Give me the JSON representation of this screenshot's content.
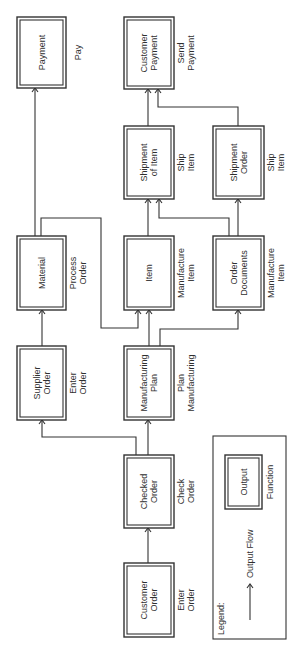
{
  "diagram": {
    "title": "",
    "orientation": "rotated-90-ccw",
    "nodes": [
      {
        "id": "payment",
        "output": [
          "Payment"
        ],
        "function": [
          "Pay"
        ],
        "x": 17,
        "y": 17,
        "w": 49,
        "h": 71
      },
      {
        "id": "customer-payment",
        "output": [
          "Customer",
          "Payment"
        ],
        "function": [
          "Send",
          "Payment"
        ],
        "x": 124,
        "y": 17,
        "w": 50,
        "h": 72
      },
      {
        "id": "shipment-of-item",
        "output": [
          "Shipment",
          "of Item"
        ],
        "function": [
          "Ship",
          "Item"
        ],
        "x": 124,
        "y": 126,
        "w": 50,
        "h": 73
      },
      {
        "id": "shipment-order",
        "output": [
          "Shipment",
          "Order"
        ],
        "function": [
          "Ship",
          "Item"
        ],
        "x": 213,
        "y": 126,
        "w": 51,
        "h": 73
      },
      {
        "id": "material",
        "output": [
          "Material"
        ],
        "function": [
          "Process",
          "Order"
        ],
        "x": 17,
        "y": 236,
        "w": 49,
        "h": 74
      },
      {
        "id": "item",
        "output": [
          "Item"
        ],
        "function": [
          "Manufacture",
          "Item"
        ],
        "x": 124,
        "y": 236,
        "w": 50,
        "h": 74
      },
      {
        "id": "order-documents",
        "output": [
          "Order",
          "Documents"
        ],
        "function": [
          "Manufacture",
          "Item"
        ],
        "x": 213,
        "y": 236,
        "w": 51,
        "h": 74
      },
      {
        "id": "supplier-order",
        "output": [
          "Supplier",
          "Order"
        ],
        "function": [
          "Enter",
          "Order"
        ],
        "x": 17,
        "y": 346,
        "w": 49,
        "h": 74
      },
      {
        "id": "manufacturing-plan",
        "output": [
          "Manufacturing",
          "Plan"
        ],
        "function": [
          "Plan",
          "Manufacturing"
        ],
        "x": 124,
        "y": 346,
        "w": 50,
        "h": 74
      },
      {
        "id": "checked-order",
        "output": [
          "Checked",
          "Order"
        ],
        "function": [
          "Check",
          "Order"
        ],
        "x": 124,
        "y": 455,
        "w": 50,
        "h": 73
      },
      {
        "id": "customer-order",
        "output": [
          "Customer",
          "Order"
        ],
        "function": [
          "Enter",
          "Order"
        ],
        "x": 124,
        "y": 563,
        "w": 50,
        "h": 74
      }
    ],
    "edges": [
      {
        "from": "customer-order",
        "to": "checked-order",
        "points": [
          [
            148,
            563
          ],
          [
            148,
            528
          ]
        ]
      },
      {
        "from": "checked-order",
        "to": "manufacturing-plan",
        "points": [
          [
            148,
            455
          ],
          [
            148,
            420
          ]
        ]
      },
      {
        "from": "checked-order",
        "to": "supplier-order",
        "points": [
          [
            136,
            455
          ],
          [
            136,
            437
          ],
          [
            42,
            437
          ],
          [
            42,
            420
          ]
        ]
      },
      {
        "from": "supplier-order",
        "to": "material",
        "points": [
          [
            42,
            346
          ],
          [
            42,
            310
          ]
        ]
      },
      {
        "from": "manufacturing-plan",
        "to": "item",
        "points": [
          [
            149,
            346
          ],
          [
            149,
            310
          ]
        ]
      },
      {
        "from": "manufacturing-plan",
        "to": "order-documents",
        "points": [
          [
            160,
            346
          ],
          [
            160,
            329
          ],
          [
            238,
            329
          ],
          [
            238,
            310
          ]
        ]
      },
      {
        "from": "material",
        "to": "payment",
        "points": [
          [
            35,
            236
          ],
          [
            35,
            88
          ]
        ]
      },
      {
        "from": "material",
        "to": "item",
        "points": [
          [
            41,
            236
          ],
          [
            41,
            218
          ],
          [
            101,
            218
          ],
          [
            101,
            328
          ],
          [
            138,
            328
          ],
          [
            138,
            310
          ]
        ]
      },
      {
        "from": "item",
        "to": "shipment-of-item",
        "points": [
          [
            148,
            236
          ],
          [
            148,
            199
          ]
        ]
      },
      {
        "from": "order-documents",
        "to": "shipment-of-item",
        "points": [
          [
            229,
            236
          ],
          [
            229,
            218
          ],
          [
            159,
            218
          ],
          [
            159,
            199
          ]
        ]
      },
      {
        "from": "order-documents",
        "to": "shipment-order",
        "points": [
          [
            238,
            236
          ],
          [
            238,
            199
          ]
        ]
      },
      {
        "from": "shipment-of-item",
        "to": "customer-payment",
        "points": [
          [
            148,
            126
          ],
          [
            148,
            89
          ]
        ]
      },
      {
        "from": "shipment-order",
        "to": "customer-payment",
        "points": [
          [
            238,
            126
          ],
          [
            238,
            107
          ],
          [
            158,
            107
          ],
          [
            158,
            89
          ]
        ]
      }
    ]
  },
  "legend": {
    "title": "Legend:",
    "flow_label": "Output Flow",
    "sample_output": "Output",
    "sample_function": "Function",
    "frame": {
      "x": 213,
      "y": 436,
      "w": 73,
      "h": 203
    },
    "sample_box": {
      "x": 225,
      "y": 455,
      "w": 37,
      "h": 54
    }
  },
  "colors": {
    "line": "#333333",
    "text": "#2f2f2f",
    "background": "#ffffff"
  }
}
